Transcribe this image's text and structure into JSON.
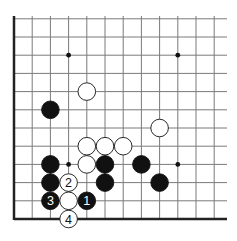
{
  "diagram": {
    "type": "go-board-fragment",
    "grid": {
      "x0": 14,
      "y_bottom": 219,
      "spacing": 18.2,
      "cols": 12,
      "rows": 12,
      "right_extent": 227,
      "top_extent": 16,
      "line_color": "#7a7a7a",
      "border_color": "#222222"
    },
    "star_points": [
      {
        "col": 3,
        "row": 9
      },
      {
        "col": 9,
        "row": 9
      },
      {
        "col": 3,
        "row": 3
      },
      {
        "col": 9,
        "row": 3
      }
    ],
    "stones": [
      {
        "color": "white",
        "col": 4,
        "row": 7,
        "label": ""
      },
      {
        "color": "black",
        "col": 2,
        "row": 6,
        "label": ""
      },
      {
        "color": "white",
        "col": 8,
        "row": 5,
        "label": ""
      },
      {
        "color": "white",
        "col": 4,
        "row": 4,
        "label": ""
      },
      {
        "color": "white",
        "col": 5,
        "row": 4,
        "label": ""
      },
      {
        "color": "white",
        "col": 6,
        "row": 4,
        "label": ""
      },
      {
        "color": "black",
        "col": 2,
        "row": 3,
        "label": ""
      },
      {
        "color": "white",
        "col": 4,
        "row": 3,
        "label": ""
      },
      {
        "color": "black",
        "col": 5,
        "row": 3,
        "label": ""
      },
      {
        "color": "black",
        "col": 7,
        "row": 3,
        "label": ""
      },
      {
        "color": "black",
        "col": 2,
        "row": 2,
        "label": ""
      },
      {
        "color": "white",
        "col": 3,
        "row": 2,
        "label": "2"
      },
      {
        "color": "black",
        "col": 5,
        "row": 2,
        "label": ""
      },
      {
        "color": "black",
        "col": 8,
        "row": 2,
        "label": ""
      },
      {
        "color": "black",
        "col": 2,
        "row": 1,
        "label": "3"
      },
      {
        "color": "white",
        "col": 3,
        "row": 1,
        "label": ""
      },
      {
        "color": "black",
        "col": 4,
        "row": 1,
        "label": "1"
      },
      {
        "color": "white",
        "col": 3,
        "row": 0,
        "label": "4"
      }
    ]
  }
}
